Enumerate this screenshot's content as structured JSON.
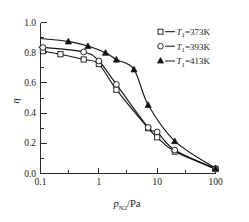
{
  "chart_data": {
    "type": "line",
    "title": "",
    "xlabel": "p_N2/Pa",
    "xlabel_base": "p",
    "xlabel_sub": "N2",
    "xlabel_unit": "/Pa",
    "ylabel": "η",
    "xscale": "log",
    "xlim": [
      0.1,
      100
    ],
    "ylim": [
      0.0,
      1.0
    ],
    "grid": false,
    "legend_position": "top-right",
    "xticks": [
      "0.1",
      "1",
      "10",
      "100"
    ],
    "xtick_values": [
      0.1,
      1,
      10,
      100
    ],
    "yticks": [
      "0.0",
      "0.2",
      "0.4",
      "0.6",
      "0.8",
      "1.0"
    ],
    "ytick_values": [
      0.0,
      0.2,
      0.4,
      0.6,
      0.8,
      1.0
    ],
    "series": [
      {
        "name": "T1=373K",
        "legend_symbol": "open-square",
        "legend_prefix": "T",
        "legend_sub": "1",
        "legend_value": "=373K",
        "marker": "square",
        "x": [
          0.11,
          0.22,
          0.55,
          1.0,
          2.0,
          7.0,
          10.0,
          20.0,
          100.0
        ],
        "y": [
          0.81,
          0.79,
          0.755,
          0.725,
          0.555,
          0.3,
          0.24,
          0.145,
          0.03
        ]
      },
      {
        "name": "T1=393K",
        "legend_symbol": "open-circle",
        "legend_prefix": "T",
        "legend_sub": "1",
        "legend_value": "=393K",
        "marker": "circle",
        "x": [
          0.11,
          0.55,
          1.0,
          2.0,
          7.0,
          10.0,
          20.0,
          100.0
        ],
        "y": [
          0.835,
          0.805,
          0.745,
          0.59,
          0.305,
          0.275,
          0.155,
          0.032
        ]
      },
      {
        "name": "T1=413K",
        "legend_symbol": "filled-triangle",
        "legend_prefix": "T",
        "legend_sub": "1",
        "legend_value": "=413K",
        "marker": "triangle",
        "x": [
          0.3,
          0.65,
          1.3,
          2.0,
          4.0,
          7.0,
          20.0,
          100.0
        ],
        "y": [
          0.875,
          0.845,
          0.8,
          0.755,
          0.69,
          0.455,
          0.215,
          0.035
        ]
      }
    ],
    "colors": {
      "axis": "#2a2a2a",
      "curve": "#111111",
      "marker_fill_open": "#ffffff",
      "marker_fill_solid": "#111111",
      "background": "#ffffff"
    }
  }
}
